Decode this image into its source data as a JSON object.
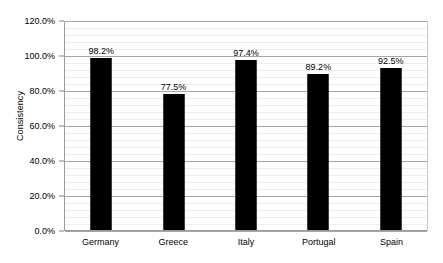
{
  "chart_data": {
    "type": "bar",
    "title": "",
    "xlabel": "",
    "ylabel": "Consistency",
    "categories": [
      "Germany",
      "Greece",
      "Italy",
      "Portugal",
      "Spain"
    ],
    "values": [
      98.2,
      77.5,
      97.4,
      89.2,
      92.5
    ],
    "value_labels": [
      "98.2%",
      "77.5%",
      "97.4%",
      "89.2%",
      "92.5%"
    ],
    "ylim": [
      0,
      120
    ],
    "y_major_step": 20,
    "y_minor_step": 4,
    "y_tick_labels": [
      "0.0%",
      "20.0%",
      "40.0%",
      "60.0%",
      "80.0%",
      "100.0%",
      "120.0%"
    ],
    "y_tick_values": [
      0,
      20,
      40,
      60,
      80,
      100,
      120
    ],
    "grid": "horizontal",
    "legend": "none",
    "bar_color": "#000000",
    "gridline_color_major": "#a6a6a6",
    "gridline_color_minor": "#ededed",
    "axis_color": "#9a9a9a",
    "background_color": "#ffffff",
    "text_color": "#000000"
  }
}
